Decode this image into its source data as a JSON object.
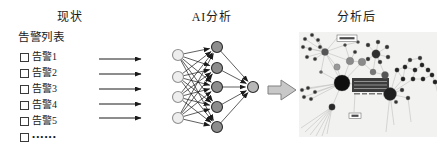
{
  "headers": {
    "left": "现状",
    "middle": "AI分析",
    "right": "分析后"
  },
  "alert_panel": {
    "title": "告警列表",
    "items": [
      "告警1",
      "告警2",
      "告警3",
      "告警4",
      "告警5"
    ],
    "more_item": "••••••"
  },
  "flow_arrows": {
    "ys": [
      24,
      39,
      54,
      69,
      83
    ],
    "x1": 4,
    "x2": 46,
    "color": "#1a1a1a"
  },
  "neural_network": {
    "node_radius": 5.5,
    "edge_color": "#1a1a1a",
    "layers": [
      {
        "name": "input",
        "x": 83,
        "ys": [
          20,
          42,
          62,
          83
        ],
        "fill": "#eeeeee",
        "stroke": "#909090"
      },
      {
        "name": "hidden",
        "x": 122,
        "ys": [
          12,
          33,
          52,
          72,
          92
        ],
        "fill": "#8d8d8d",
        "stroke": "#2b2b2b"
      },
      {
        "name": "output",
        "x": 158,
        "ys": [
          52
        ],
        "fill": "#b7b7b7",
        "stroke": "#2b2b2b"
      }
    ]
  },
  "block_arrow": {
    "points": "173,51 186,51 186,45 201,55 186,65 186,59 173,59",
    "fill": "#c8c8c8",
    "stroke": "#808080"
  },
  "graph_panel": {
    "background": "#f2f2f0",
    "width": 138,
    "height": 105,
    "edge_color": "#bfbfbd",
    "nodes": [
      {
        "x": 6,
        "y": 7,
        "r": 1.8,
        "c": "#333333"
      },
      {
        "x": 13,
        "y": 3,
        "r": 1.8,
        "c": "#333333"
      },
      {
        "x": 19,
        "y": 8,
        "r": 1.8,
        "c": "#333333"
      },
      {
        "x": 4,
        "y": 15,
        "r": 1.8,
        "c": "#333333"
      },
      {
        "x": 11,
        "y": 17,
        "r": 1.8,
        "c": "#333333"
      },
      {
        "x": 21,
        "y": 15,
        "r": 1.8,
        "c": "#333333"
      },
      {
        "x": 8,
        "y": 25,
        "r": 1.8,
        "c": "#333333"
      },
      {
        "x": 16,
        "y": 27,
        "r": 1.8,
        "c": "#333333"
      },
      {
        "x": 26,
        "y": 20,
        "r": 3.5,
        "c": "#555555"
      },
      {
        "x": 38,
        "y": 35,
        "r": 3.2,
        "c": "#999999"
      },
      {
        "x": 51,
        "y": 29,
        "r": 3.8,
        "c": "#8a8a8a"
      },
      {
        "x": 63,
        "y": 30,
        "r": 3.8,
        "c": "#8a8a8a"
      },
      {
        "x": 74,
        "y": 40,
        "r": 3.0,
        "c": "#787878"
      },
      {
        "x": 86,
        "y": 43,
        "r": 3.5,
        "c": "#555555"
      },
      {
        "x": 46,
        "y": 13,
        "r": 1.6,
        "c": "#444444"
      },
      {
        "x": 56,
        "y": 20,
        "r": 1.8,
        "c": "#333333"
      },
      {
        "x": 59,
        "y": 10,
        "r": 1.6,
        "c": "#444444"
      },
      {
        "x": 77,
        "y": 22,
        "r": 4.2,
        "c": "#2e2e2e"
      },
      {
        "x": 69,
        "y": 13,
        "r": 2,
        "c": "#333333"
      },
      {
        "x": 79,
        "y": 10,
        "r": 2,
        "c": "#333333"
      },
      {
        "x": 88,
        "y": 15,
        "r": 2,
        "c": "#333333"
      },
      {
        "x": 69,
        "y": 27,
        "r": 2,
        "c": "#333333"
      },
      {
        "x": 81,
        "y": 30,
        "r": 2,
        "c": "#333333"
      },
      {
        "x": 89,
        "y": 25,
        "r": 2,
        "c": "#333333"
      },
      {
        "x": 98,
        "y": 38,
        "r": 2.2,
        "c": "#222222"
      },
      {
        "x": 106,
        "y": 35,
        "r": 2.2,
        "c": "#222222"
      },
      {
        "x": 116,
        "y": 38,
        "r": 2.2,
        "c": "#222222"
      },
      {
        "x": 123,
        "y": 33,
        "r": 2.2,
        "c": "#222222"
      },
      {
        "x": 129,
        "y": 38,
        "r": 2.2,
        "c": "#222222"
      },
      {
        "x": 104,
        "y": 47,
        "r": 2.2,
        "c": "#222222"
      },
      {
        "x": 114,
        "y": 47,
        "r": 2.2,
        "c": "#222222"
      },
      {
        "x": 124,
        "y": 47,
        "r": 2.2,
        "c": "#222222"
      },
      {
        "x": 133,
        "y": 43,
        "r": 2.2,
        "c": "#222222"
      },
      {
        "x": 136,
        "y": 50,
        "r": 2.2,
        "c": "#222222"
      },
      {
        "x": 111,
        "y": 28,
        "r": 2,
        "c": "#333333"
      },
      {
        "x": 121,
        "y": 26,
        "r": 2,
        "c": "#333333"
      },
      {
        "x": 43,
        "y": 51,
        "r": 8,
        "c": "#0f0f0f"
      },
      {
        "x": 91,
        "y": 62,
        "r": 6.5,
        "c": "#1f1f1f"
      },
      {
        "x": 3,
        "y": 58,
        "r": 1.8,
        "c": "#333333"
      },
      {
        "x": 9,
        "y": 56,
        "r": 1.8,
        "c": "#333333"
      },
      {
        "x": 16,
        "y": 60,
        "r": 1.8,
        "c": "#333333"
      },
      {
        "x": 5,
        "y": 65,
        "r": 1.8,
        "c": "#333333"
      },
      {
        "x": 12,
        "y": 67,
        "r": 1.8,
        "c": "#333333"
      },
      {
        "x": 33,
        "y": 75,
        "r": 3.2,
        "c": "#2a2a2a"
      },
      {
        "x": 103,
        "y": 58,
        "r": 2,
        "c": "#333333"
      },
      {
        "x": 109,
        "y": 66,
        "r": 2,
        "c": "#333333"
      },
      {
        "x": 22,
        "y": 40,
        "r": 1.6,
        "c": "#666666"
      },
      {
        "x": 97,
        "y": 70,
        "r": 1.8,
        "c": "#333333"
      }
    ],
    "edges": [
      [
        8,
        0
      ],
      [
        8,
        1
      ],
      [
        8,
        2
      ],
      [
        8,
        3
      ],
      [
        8,
        4
      ],
      [
        8,
        5
      ],
      [
        8,
        6
      ],
      [
        8,
        7
      ],
      [
        8,
        9
      ],
      [
        8,
        10
      ],
      [
        8,
        36
      ],
      [
        8,
        46
      ],
      [
        46,
        36
      ],
      [
        9,
        36
      ],
      [
        10,
        36
      ],
      [
        11,
        36
      ],
      [
        10,
        11
      ],
      [
        11,
        12
      ],
      [
        12,
        17
      ],
      [
        12,
        13
      ],
      [
        13,
        37
      ],
      [
        14,
        10
      ],
      [
        15,
        10
      ],
      [
        16,
        14
      ],
      [
        14,
        8
      ],
      [
        17,
        18
      ],
      [
        17,
        19
      ],
      [
        17,
        20
      ],
      [
        17,
        21
      ],
      [
        17,
        22
      ],
      [
        17,
        23
      ],
      [
        17,
        13
      ],
      [
        24,
        25
      ],
      [
        25,
        26
      ],
      [
        26,
        27
      ],
      [
        27,
        28
      ],
      [
        24,
        29
      ],
      [
        25,
        29
      ],
      [
        26,
        30
      ],
      [
        30,
        31
      ],
      [
        31,
        32
      ],
      [
        32,
        33
      ],
      [
        28,
        32
      ],
      [
        27,
        35
      ],
      [
        35,
        34
      ],
      [
        34,
        25
      ],
      [
        37,
        24
      ],
      [
        37,
        29
      ],
      [
        37,
        30
      ],
      [
        37,
        44
      ],
      [
        37,
        45
      ],
      [
        37,
        13
      ],
      [
        37,
        47
      ],
      [
        36,
        38
      ],
      [
        36,
        39
      ],
      [
        36,
        40
      ],
      [
        36,
        41
      ],
      [
        36,
        42
      ],
      [
        36,
        43
      ]
    ],
    "extra_lines": [
      [
        33,
        75,
        2,
        96
      ],
      [
        33,
        75,
        6,
        100
      ],
      [
        33,
        75,
        11,
        103
      ],
      [
        33,
        75,
        17,
        104
      ],
      [
        33,
        75,
        23,
        104
      ],
      [
        33,
        75,
        28,
        102
      ],
      [
        91,
        62,
        87,
        100
      ],
      [
        91,
        62,
        95,
        93
      ],
      [
        109,
        66,
        112,
        90
      ],
      [
        136,
        50,
        139,
        62
      ],
      [
        56,
        62,
        55,
        80
      ],
      [
        38,
        6,
        28,
        18
      ],
      [
        43,
        51,
        55,
        52
      ]
    ],
    "dark_table": {
      "x": 53,
      "y": 46,
      "w": 37,
      "h": 14,
      "fill": "#3c3c3c",
      "row_ys": [
        49.5,
        53,
        56.5
      ],
      "row_color": "#9a9a9a"
    },
    "sub_marks": [
      [
        55,
        61,
        6,
        1.5
      ],
      [
        63,
        61,
        5,
        1.5
      ],
      [
        70,
        61,
        6,
        1.5
      ],
      [
        78,
        61,
        5,
        1.5
      ]
    ],
    "label_boxes": [
      {
        "x": 38,
        "y": 3,
        "w": 20,
        "h": 6.5
      },
      {
        "x": 50,
        "y": 81,
        "w": 12,
        "h": 5.5
      }
    ]
  }
}
